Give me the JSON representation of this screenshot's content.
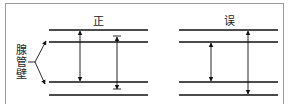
{
  "diagram": {
    "panels": [
      {
        "label": "正",
        "meaning": "correct"
      },
      {
        "label": "误",
        "meaning": "incorrect"
      }
    ],
    "side_label": [
      "腺",
      "管",
      "壁"
    ],
    "colors": {
      "line": "#111111",
      "frame": "#9a9a9a"
    }
  }
}
